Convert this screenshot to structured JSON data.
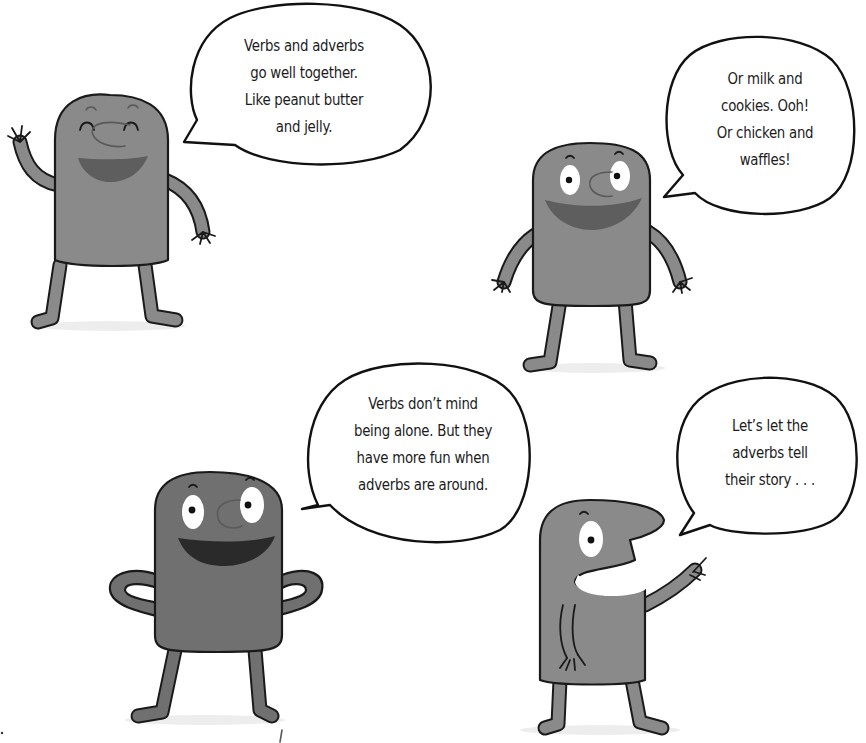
{
  "page": {
    "background": "#ffffff",
    "character_fill": "#8a8a8a",
    "character_dark_fill": "#6f6f6f",
    "outline": "#1a1a1a"
  },
  "bubbles": [
    {
      "id": "top-left",
      "lines": [
        "Verbs and adverbs",
        "go well together.",
        "Like peanut butter",
        "and jelly."
      ]
    },
    {
      "id": "top-right",
      "lines": [
        "Or milk and",
        "cookies. Ooh!",
        "Or chicken and",
        "waffles!"
      ]
    },
    {
      "id": "bottom-left",
      "lines": [
        "Verbs don’t mind",
        "being alone. But they",
        "have more fun when",
        "adverbs are around."
      ]
    },
    {
      "id": "bottom-right",
      "lines": [
        "Let’s let the",
        "adverbs tell",
        "their story . . ."
      ]
    }
  ],
  "characters": [
    {
      "name": "waving-character",
      "pose": "waving, eyes closed, smiling"
    },
    {
      "name": "smiling-character",
      "pose": "arms out, wide eyes, smiling"
    },
    {
      "name": "hands-on-hips-character",
      "pose": "hands on hips, open-mouth laugh"
    },
    {
      "name": "pointing-character",
      "pose": "side profile, pointing up"
    }
  ]
}
